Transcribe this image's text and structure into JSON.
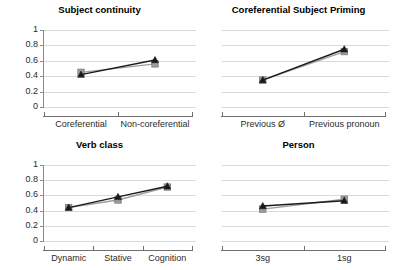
{
  "figure": {
    "background": "#ffffff",
    "panel_count": 4
  },
  "colors": {
    "observed": "#9e9e9e",
    "predicted": "#1a1a1a",
    "gridline": "#d9d9d9",
    "axis": "#6f6f6f",
    "text": "#111111"
  },
  "chart_data": [
    {
      "type": "line",
      "title": "Subject continuity",
      "xlabel": "",
      "ylabel": "",
      "categories": [
        "Coreferential",
        "Non-coreferential"
      ],
      "yticks": [
        "0",
        "0.2",
        "0.4",
        "0.6",
        "0.8",
        "1"
      ],
      "ytick_values": [
        0,
        0.2,
        0.4,
        0.6,
        0.8,
        1
      ],
      "ylim": [
        0,
        1
      ],
      "grid": true,
      "legend": "none",
      "series": [
        {
          "name": "observed",
          "marker": "square",
          "color": "#9e9e9e",
          "values": [
            0.45,
            0.56
          ]
        },
        {
          "name": "predicted",
          "marker": "triangle",
          "color": "#1a1a1a",
          "values": [
            0.42,
            0.61
          ]
        }
      ]
    },
    {
      "type": "line",
      "title": "Coreferential Subject Priming",
      "xlabel": "",
      "ylabel": "",
      "categories": [
        "Previous Ø",
        "Previous pronoun"
      ],
      "yticks": [
        "0",
        "0.2",
        "0.4",
        "0.6",
        "0.8",
        "1"
      ],
      "ytick_values": [
        0,
        0.2,
        0.4,
        0.6,
        0.8,
        1
      ],
      "ylim": [
        0,
        1
      ],
      "grid": true,
      "legend": "none",
      "series": [
        {
          "name": "observed",
          "marker": "square",
          "color": "#9e9e9e",
          "values": [
            0.35,
            0.72
          ]
        },
        {
          "name": "predicted",
          "marker": "triangle",
          "color": "#1a1a1a",
          "values": [
            0.35,
            0.75
          ]
        }
      ]
    },
    {
      "type": "line",
      "title": "Verb class",
      "xlabel": "",
      "ylabel": "",
      "categories": [
        "Dynamic",
        "Stative",
        "Cognition"
      ],
      "yticks": [
        "0",
        "0.2",
        "0.4",
        "0.6",
        "0.8",
        "1"
      ],
      "ytick_values": [
        0,
        0.2,
        0.4,
        0.6,
        0.8,
        1
      ],
      "ylim": [
        0,
        1
      ],
      "grid": true,
      "legend": "none",
      "series": [
        {
          "name": "observed",
          "marker": "square",
          "color": "#9e9e9e",
          "values": [
            0.44,
            0.54,
            0.71
          ]
        },
        {
          "name": "predicted",
          "marker": "triangle",
          "color": "#1a1a1a",
          "values": [
            0.44,
            0.58,
            0.72
          ]
        }
      ]
    },
    {
      "type": "line",
      "title": "Person",
      "xlabel": "",
      "ylabel": "",
      "categories": [
        "3sg",
        "1sg"
      ],
      "yticks": [
        "0",
        "0.2",
        "0.4",
        "0.6",
        "0.8",
        "1"
      ],
      "ytick_values": [
        0,
        0.2,
        0.4,
        0.6,
        0.8,
        1
      ],
      "ylim": [
        0,
        1
      ],
      "grid": true,
      "legend": "none",
      "series": [
        {
          "name": "observed",
          "marker": "square",
          "color": "#9e9e9e",
          "values": [
            0.42,
            0.55
          ]
        },
        {
          "name": "predicted",
          "marker": "triangle",
          "color": "#1a1a1a",
          "values": [
            0.46,
            0.53
          ]
        }
      ]
    }
  ]
}
